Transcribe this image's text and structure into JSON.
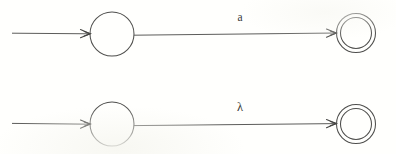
{
  "figure": {
    "background_color": "#fffffd",
    "stroke_color": "#5c5c5a",
    "label_color": "#3a3a38",
    "width": 396,
    "height": 154
  },
  "automata": [
    {
      "id": "automaton-top",
      "start_arrow": {
        "name": "start-arrow",
        "from_x": 12,
        "to_x": 90,
        "y": 33
      },
      "start_state": {
        "name": "start-state",
        "cx": 112,
        "cy": 34,
        "r": 22,
        "accepting": false,
        "label": ""
      },
      "transition": {
        "name": "transition-a",
        "symbol": "a",
        "label_x": 240,
        "label_y": 21,
        "from_x": 134,
        "from_y": 35,
        "to_x": 336,
        "to_y": 33
      },
      "accept_state": {
        "name": "accept-state",
        "cx": 356,
        "cy": 33,
        "r_outer": 19.5,
        "r_inner": 15.5,
        "accepting": true,
        "label": ""
      }
    },
    {
      "id": "automaton-bottom",
      "start_arrow": {
        "name": "start-arrow",
        "from_x": 12,
        "to_x": 90,
        "y": 124
      },
      "start_state": {
        "name": "start-state",
        "cx": 112,
        "cy": 124,
        "r": 22,
        "accepting": false,
        "label": ""
      },
      "transition": {
        "name": "transition-lambda",
        "symbol": "λ",
        "label_x": 240,
        "label_y": 111,
        "from_x": 134,
        "from_y": 126,
        "to_x": 336,
        "to_y": 124
      },
      "accept_state": {
        "name": "accept-state",
        "cx": 356,
        "cy": 124,
        "r_outer": 19.5,
        "r_inner": 15.5,
        "accepting": true,
        "label": ""
      }
    }
  ]
}
